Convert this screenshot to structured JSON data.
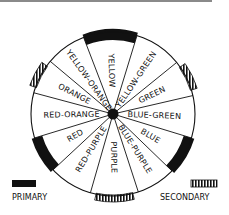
{
  "diagram": {
    "center": [
      113,
      114
    ],
    "radius": 82,
    "segments": [
      {
        "label": "YELLOW",
        "start": -111,
        "end": -73,
        "type": "primary"
      },
      {
        "label": "YELLOW-GREEN",
        "start": -73,
        "end": -39,
        "type": "tertiary"
      },
      {
        "label": "GREEN",
        "start": -39,
        "end": -13,
        "type": "secondary"
      },
      {
        "label": "BLUE-GREEN",
        "start": -13,
        "end": 17,
        "type": "tertiary"
      },
      {
        "label": "BLUE",
        "start": 17,
        "end": 44,
        "type": "primary"
      },
      {
        "label": "BLUE-PURPLE",
        "start": 44,
        "end": 72,
        "type": "tertiary"
      },
      {
        "label": "PURPLE",
        "start": 72,
        "end": 106,
        "type": "secondary"
      },
      {
        "label": "RED-PURPLE",
        "start": 106,
        "end": 137,
        "type": "tertiary"
      },
      {
        "label": "RED",
        "start": 137,
        "end": 163,
        "type": "primary"
      },
      {
        "label": "RED-ORANGE",
        "start": 163,
        "end": 195,
        "type": "tertiary"
      },
      {
        "label": "ORANGE",
        "start": 195,
        "end": 220,
        "type": "secondary"
      },
      {
        "label": "YELLOW-ORANGE",
        "start": 220,
        "end": 249,
        "type": "tertiary"
      }
    ]
  },
  "legend": {
    "primary_label": "PRIMARY",
    "secondary_label": "SECONDARY"
  },
  "colors": {
    "ink": "#111111",
    "background": "#ffffff",
    "rule": "#8a8a8a"
  }
}
